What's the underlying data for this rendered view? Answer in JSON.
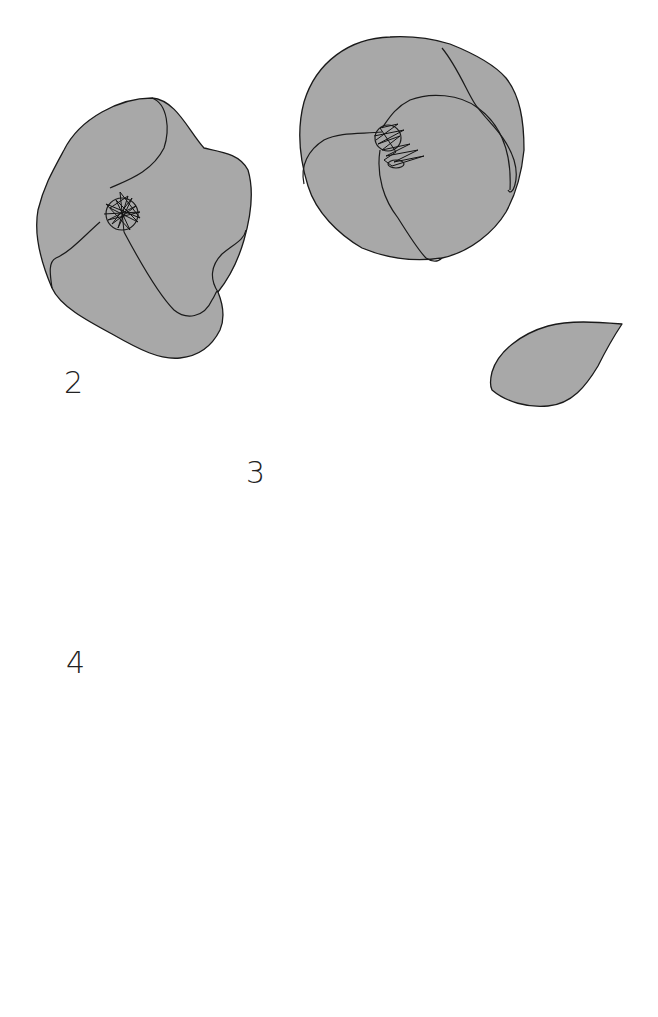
{
  "page": {
    "background": "#ffffff",
    "fill_color": "#a8a8a8",
    "stroke_color": "#1a1a1a"
  },
  "labels": {
    "step2": "2",
    "step3": "3",
    "step4": "4"
  },
  "pieces": [
    {
      "id": "open-flower-left",
      "description": "Open flower with scribbled center"
    },
    {
      "id": "open-flower-right",
      "description": "Rounded flower with layered petals and scribbled center"
    },
    {
      "id": "small-leaf",
      "description": "Small pointed leaf"
    },
    {
      "id": "round-petal",
      "description": "Large rounded heart-like petal"
    },
    {
      "id": "large-leaf",
      "description": "Large lens-shaped leaf"
    },
    {
      "id": "spiral-rose",
      "description": "Spiral rose cutout"
    }
  ]
}
